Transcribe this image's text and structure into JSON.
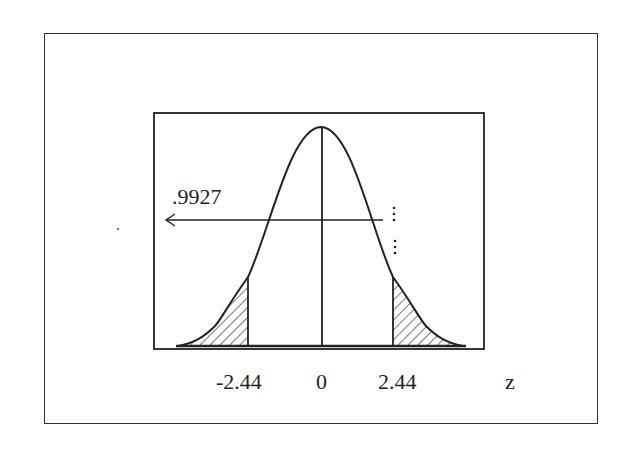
{
  "diagram": {
    "annotation": {
      "value_label": ".9927",
      "arrow_direction": "left"
    },
    "axis": {
      "tick_labels": [
        "-2.44",
        "0",
        "2.44"
      ],
      "variable_label": "z"
    },
    "shaded_regions": [
      "left tail below -2.44",
      "right tail above 2.44"
    ],
    "colors": {
      "stroke": "#222222",
      "background": "#ffffff"
    }
  }
}
